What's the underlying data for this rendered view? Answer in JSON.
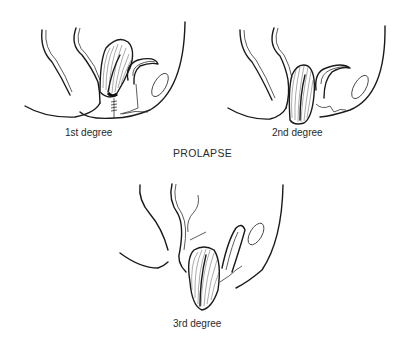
{
  "figure": {
    "title": "PROLAPSE",
    "panels": [
      {
        "id": "first",
        "label": "1st degree"
      },
      {
        "id": "second",
        "label": "2nd degree"
      },
      {
        "id": "third",
        "label": "3rd degree"
      }
    ]
  }
}
